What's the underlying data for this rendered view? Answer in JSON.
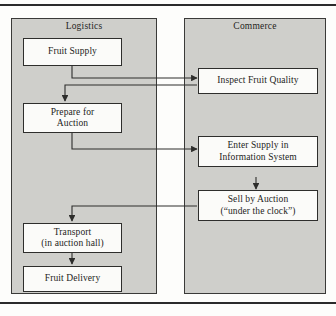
{
  "diagram": {
    "colors": {
      "panel_fill": "#cfcfcb",
      "node_fill": "#fbfbf9",
      "stroke": "#2e2e2c",
      "page_background": "#fdfdfb"
    },
    "lanes": [
      {
        "id": "logistics",
        "label": "Logistics"
      },
      {
        "id": "commerce",
        "label": "Commerce"
      }
    ],
    "nodes": [
      {
        "id": "fruit-supply",
        "lane": "logistics",
        "lines": [
          "Fruit Supply"
        ]
      },
      {
        "id": "prepare-for-auction",
        "lane": "logistics",
        "lines": [
          "Prepare for",
          "Auction"
        ]
      },
      {
        "id": "transport",
        "lane": "logistics",
        "lines": [
          "Transport",
          "(in auction hall)"
        ]
      },
      {
        "id": "fruit-delivery",
        "lane": "logistics",
        "lines": [
          "Fruit Delivery"
        ]
      },
      {
        "id": "inspect-fruit-quality",
        "lane": "commerce",
        "lines": [
          "Inspect Fruit Quality"
        ]
      },
      {
        "id": "enter-supply",
        "lane": "commerce",
        "lines": [
          "Enter Supply in",
          "Information System"
        ]
      },
      {
        "id": "sell-by-auction",
        "lane": "commerce",
        "lines": [
          "Sell by Auction",
          "(“under the clock”)"
        ]
      }
    ],
    "edges": [
      {
        "from": "fruit-supply",
        "to": "inspect-fruit-quality"
      },
      {
        "from": "inspect-fruit-quality",
        "to": "prepare-for-auction"
      },
      {
        "from": "prepare-for-auction",
        "to": "enter-supply"
      },
      {
        "from": "enter-supply",
        "to": "sell-by-auction"
      },
      {
        "from": "sell-by-auction",
        "to": "transport"
      },
      {
        "from": "transport",
        "to": "fruit-delivery"
      }
    ]
  }
}
